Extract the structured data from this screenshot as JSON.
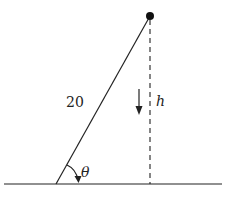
{
  "diagram": {
    "type": "geometry-figure",
    "labels": {
      "length": "20",
      "height": "h",
      "angle": "θ"
    },
    "colors": {
      "stroke": "#222222",
      "background": "#ffffff"
    },
    "geometry": {
      "ground": {
        "x1": 4,
        "y1": 184,
        "x2": 222,
        "y2": 184
      },
      "incline": {
        "x1": 56,
        "y1": 184,
        "x2": 150,
        "y2": 16
      },
      "height_dashed": {
        "x1": 150,
        "y1": 18,
        "x2": 150,
        "y2": 184
      },
      "point": {
        "cx": 150,
        "cy": 16,
        "r": 4
      }
    }
  }
}
